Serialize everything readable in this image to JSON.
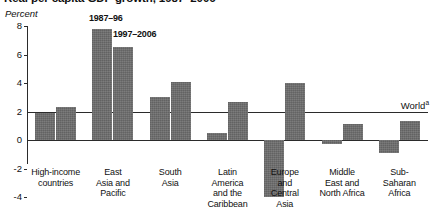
{
  "figure": {
    "title": "Real per capita GDP growth, 1987–2006",
    "axis_unit_label": "Percent",
    "world_label": "World",
    "world_superscript": "a",
    "bar_color": "#6e6e6e",
    "axis_color": "#2b2b2b"
  },
  "chart_data": {
    "type": "bar",
    "title": "Real per capita GDP growth, 1987–2006",
    "xlabel": "",
    "ylabel": "Percent",
    "ylim": [
      -4,
      8
    ],
    "yticks": [
      8,
      6,
      4,
      2,
      0,
      -2,
      -4
    ],
    "ytick_labels": [
      "8",
      "6",
      "4",
      "2",
      "0",
      "-2",
      "-4"
    ],
    "grid": false,
    "legend_position": "inline-annotation",
    "categories": [
      "High-income countries",
      "East Asia and Pacific",
      "South Asia",
      "Latin America and the Caribbean",
      "Europe and Central Asia",
      "Middle East and North Africa",
      "Sub-Saharan Africa"
    ],
    "category_label_lines": [
      [
        "High-income",
        "countries"
      ],
      [
        "East",
        "Asia and",
        "Pacific"
      ],
      [
        "South",
        "Asia"
      ],
      [
        "Latin",
        "America",
        "and the",
        "Caribbean"
      ],
      [
        "Europe",
        "and",
        "Central",
        "Asia"
      ],
      [
        "Middle",
        "East and",
        "North Africa"
      ],
      [
        "Sub-",
        "Saharan",
        "Africa"
      ]
    ],
    "series": [
      {
        "name": "1987–96",
        "values": [
          1.9,
          7.8,
          3.0,
          0.5,
          -4.0,
          -0.3,
          -0.9
        ]
      },
      {
        "name": "1997–2006",
        "values": [
          2.3,
          6.5,
          4.1,
          2.7,
          4.0,
          1.1,
          1.3
        ]
      }
    ],
    "annotations": [
      {
        "text": "1987–96",
        "kind": "series-label"
      },
      {
        "text": "1997–2006",
        "kind": "series-label"
      },
      {
        "text": "World",
        "kind": "reference-line",
        "value": 2.0,
        "superscript": "a"
      }
    ]
  }
}
